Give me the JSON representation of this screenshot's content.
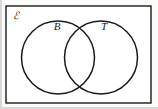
{
  "figure": {
    "type": "venn-diagram",
    "universal_set_label": "ℰ",
    "background_color": "#fbfbfa",
    "stroke_color": "#1a1a1a",
    "fill_color": "#ffffff",
    "frame": {
      "x": 6,
      "y": 6,
      "width": 145,
      "height": 97,
      "stroke_width": 1.4
    },
    "sets": [
      {
        "label": "B",
        "name": "set-b",
        "cx": 58,
        "cy": 57.5,
        "r": 36.5,
        "label_x": 57,
        "label_y": 30
      },
      {
        "label": "T",
        "name": "set-t",
        "cx": 101,
        "cy": 57.5,
        "r": 36.5,
        "label_x": 104,
        "label_y": 30
      }
    ],
    "intersections": [
      {
        "x": 79.5,
        "y": 25.3
      },
      {
        "x": 79.5,
        "y": 89.7
      }
    ],
    "universal_label_pos": {
      "x": 13,
      "y": 19
    }
  }
}
